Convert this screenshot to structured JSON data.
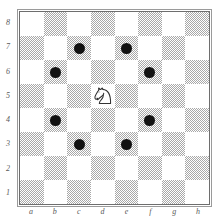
{
  "diagram": {
    "board_size": 8,
    "orientation": "white-bottom",
    "colors": {
      "light_square": "#ffffff",
      "dark_square": "#a8a8a8",
      "marker": "#111111",
      "piece_outline": "#333333",
      "piece_fill": "#ffffff",
      "border": "#6e6e6e",
      "label": "#5a5a5a"
    }
  },
  "labels": {
    "files": [
      "a",
      "b",
      "c",
      "d",
      "e",
      "f",
      "g",
      "h"
    ],
    "ranks": [
      "8",
      "7",
      "6",
      "5",
      "4",
      "3",
      "2",
      "1"
    ]
  },
  "chart_data": {
    "type": "table",
    "xlabel": "file",
    "ylabel": "rank",
    "categories": [
      "a",
      "b",
      "c",
      "d",
      "e",
      "f",
      "g",
      "h"
    ],
    "rows": [
      "8",
      "7",
      "6",
      "5",
      "4",
      "3",
      "2",
      "1"
    ],
    "pieces": [
      {
        "square": "d5",
        "piece": "knight",
        "color": "white",
        "glyph": "N"
      }
    ],
    "markers": [
      {
        "square": "c7",
        "kind": "move-target"
      },
      {
        "square": "e7",
        "kind": "move-target"
      },
      {
        "square": "b6",
        "kind": "move-target"
      },
      {
        "square": "f6",
        "kind": "move-target"
      },
      {
        "square": "b4",
        "kind": "move-target"
      },
      {
        "square": "f4",
        "kind": "move-target"
      },
      {
        "square": "c3",
        "kind": "move-target"
      },
      {
        "square": "e3",
        "kind": "move-target"
      }
    ],
    "square_shading": [
      [
        "light",
        "dark",
        "light",
        "dark",
        "light",
        "dark",
        "light",
        "dark"
      ],
      [
        "dark",
        "light",
        "dark",
        "light",
        "dark",
        "light",
        "dark",
        "light"
      ],
      [
        "light",
        "dark",
        "light",
        "dark",
        "light",
        "dark",
        "light",
        "dark"
      ],
      [
        "dark",
        "light",
        "dark",
        "light",
        "dark",
        "light",
        "dark",
        "light"
      ],
      [
        "light",
        "dark",
        "light",
        "dark",
        "light",
        "dark",
        "light",
        "dark"
      ],
      [
        "dark",
        "light",
        "dark",
        "light",
        "dark",
        "light",
        "dark",
        "light"
      ],
      [
        "light",
        "dark",
        "light",
        "dark",
        "light",
        "dark",
        "light",
        "dark"
      ],
      [
        "dark",
        "light",
        "dark",
        "light",
        "dark",
        "light",
        "dark",
        "light"
      ]
    ]
  }
}
